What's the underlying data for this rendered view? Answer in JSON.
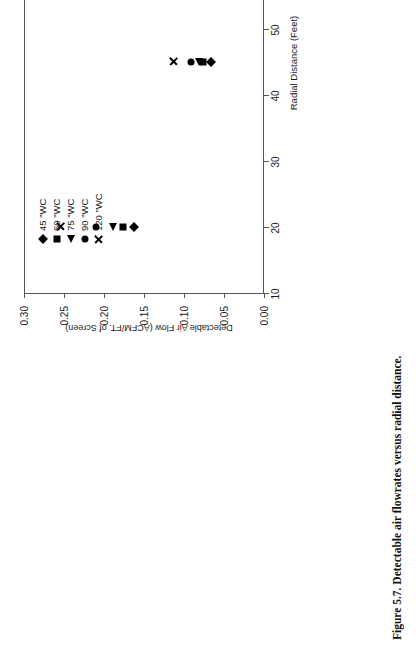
{
  "figure": {
    "caption": "Figure 5.7.  Detectable air flowrates versus radial distance.",
    "orientation": "rotated-90-ccw"
  },
  "chart_data": {
    "type": "scatter",
    "title": "",
    "xlabel": "Radial Distance (Feet)",
    "ylabel": "Detectable Air Flow (ACFM/FT. of Screen)",
    "xlim": [
      10,
      80
    ],
    "ylim": [
      0.0,
      0.3
    ],
    "xticks": [
      10,
      20,
      30,
      40,
      50,
      60,
      70,
      80
    ],
    "xticklabels": [
      "10",
      "20",
      "30",
      "40",
      "50",
      "60",
      "70",
      "80"
    ],
    "yticks": [
      0.0,
      0.05,
      0.1,
      0.15,
      0.2,
      0.25,
      0.3
    ],
    "yticklabels": [
      "0.00",
      "0.05",
      "0.10",
      "0.15",
      "0.20",
      "0.25",
      "0.30"
    ],
    "grid": false,
    "legend_position": "upper-left",
    "marker_color": "#000000",
    "series": [
      {
        "name": "45 \"WC",
        "marker": "diamond",
        "x": [
          20,
          45,
          75
        ],
        "y": [
          0.164,
          0.068,
          0.037
        ]
      },
      {
        "name": "60 \"WC",
        "marker": "square",
        "x": [
          20,
          45,
          75
        ],
        "y": [
          0.177,
          0.077,
          0.042
        ]
      },
      {
        "name": "75 \"WC",
        "marker": "triangle",
        "x": [
          20,
          45,
          75
        ],
        "y": [
          0.19,
          0.082,
          0.047
        ]
      },
      {
        "name": "90 \"WC",
        "marker": "circle",
        "x": [
          20,
          45,
          75
        ],
        "y": [
          0.211,
          0.093,
          0.052
        ]
      },
      {
        "name": "120 \"WC",
        "marker": "cross",
        "x": [
          20,
          45,
          75
        ],
        "y": [
          0.256,
          0.115,
          0.063
        ]
      }
    ]
  },
  "legend": {
    "items": [
      {
        "label": "45 \"WC",
        "marker": "diamond"
      },
      {
        "label": "60 \"WC",
        "marker": "square"
      },
      {
        "label": "75 \"WC",
        "marker": "triangle"
      },
      {
        "label": "90 \"WC",
        "marker": "circle"
      },
      {
        "label": "120 \"WC",
        "marker": "cross"
      }
    ]
  }
}
